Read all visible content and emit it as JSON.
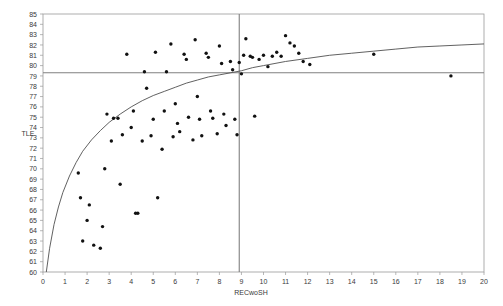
{
  "chart_data": {
    "type": "scatter",
    "title": "",
    "xlabel": "RECwoSH",
    "ylabel": "TLE",
    "xlim": [
      0,
      20
    ],
    "ylim": [
      60,
      85
    ],
    "grid": false,
    "legend": null,
    "x_ticks": [
      0,
      1,
      2,
      3,
      4,
      5,
      6,
      7,
      8,
      9,
      10,
      11,
      12,
      13,
      14,
      15,
      16,
      17,
      18,
      19,
      20
    ],
    "y_ticks": [
      60,
      61,
      62,
      63,
      64,
      65,
      66,
      67,
      68,
      69,
      70,
      71,
      72,
      73,
      74,
      75,
      76,
      77,
      78,
      79,
      80,
      81,
      82,
      83,
      84,
      85
    ],
    "x_tick_labels": [
      "0",
      "1",
      "2",
      "3",
      "4",
      "5",
      "6",
      "7",
      "8",
      "9",
      "10",
      "11",
      "12",
      "13",
      "14",
      "15",
      "16",
      "17",
      "18",
      "19",
      "20"
    ],
    "y_tick_labels": [
      "60",
      "61",
      "62",
      "63",
      "64",
      "65",
      "66",
      "67",
      "68",
      "69",
      "70",
      "71",
      "72",
      "73",
      "74",
      "75",
      "76",
      "77",
      "78",
      "79",
      "80",
      "81",
      "82",
      "83",
      "84",
      "85"
    ],
    "reference_lines": [
      {
        "orientation": "horizontal",
        "value": 79.3,
        "color": "#808080"
      },
      {
        "orientation": "vertical",
        "value": 8.9,
        "color": "#808080"
      }
    ],
    "fit_curve": {
      "kind": "logarithmic",
      "color": "#4f4f4f",
      "points": [
        [
          0.15,
          60.0
        ],
        [
          0.3,
          62.3
        ],
        [
          0.5,
          64.6
        ],
        [
          0.7,
          66.3
        ],
        [
          0.9,
          67.7
        ],
        [
          1.2,
          69.3
        ],
        [
          1.5,
          70.6
        ],
        [
          1.8,
          71.7
        ],
        [
          2.2,
          72.8
        ],
        [
          2.6,
          73.7
        ],
        [
          3.0,
          74.5
        ],
        [
          3.5,
          75.3
        ],
        [
          4.0,
          76.0
        ],
        [
          4.5,
          76.6
        ],
        [
          5.0,
          77.1
        ],
        [
          5.5,
          77.5
        ],
        [
          6.0,
          77.9
        ],
        [
          6.5,
          78.3
        ],
        [
          7.0,
          78.6
        ],
        [
          7.5,
          78.9
        ],
        [
          8.0,
          79.1
        ],
        [
          8.5,
          79.3
        ],
        [
          9.0,
          79.5
        ],
        [
          9.5,
          79.8
        ],
        [
          10.0,
          80.0
        ],
        [
          11.0,
          80.4
        ],
        [
          12.0,
          80.7
        ],
        [
          13.0,
          81.0
        ],
        [
          14.0,
          81.2
        ],
        [
          15.0,
          81.4
        ],
        [
          16.0,
          81.6
        ],
        [
          17.0,
          81.8
        ],
        [
          18.0,
          81.9
        ],
        [
          19.0,
          82.0
        ],
        [
          20.0,
          82.1
        ]
      ]
    },
    "points": [
      [
        1.6,
        69.6
      ],
      [
        1.7,
        67.2
      ],
      [
        1.8,
        63.0
      ],
      [
        2.0,
        65.0
      ],
      [
        2.1,
        66.5
      ],
      [
        2.3,
        62.6
      ],
      [
        2.6,
        62.3
      ],
      [
        2.7,
        64.4
      ],
      [
        2.8,
        70.0
      ],
      [
        2.9,
        75.3
      ],
      [
        3.1,
        72.7
      ],
      [
        3.2,
        74.9
      ],
      [
        3.4,
        74.9
      ],
      [
        3.5,
        68.5
      ],
      [
        3.6,
        73.3
      ],
      [
        3.8,
        81.1
      ],
      [
        4.0,
        74.0
      ],
      [
        4.1,
        75.6
      ],
      [
        4.2,
        65.7
      ],
      [
        4.3,
        65.7
      ],
      [
        4.5,
        72.7
      ],
      [
        4.6,
        79.4
      ],
      [
        4.7,
        77.8
      ],
      [
        4.9,
        73.2
      ],
      [
        5.0,
        74.8
      ],
      [
        5.1,
        81.3
      ],
      [
        5.2,
        67.2
      ],
      [
        5.4,
        71.9
      ],
      [
        5.5,
        75.6
      ],
      [
        5.6,
        79.4
      ],
      [
        5.8,
        82.1
      ],
      [
        5.9,
        73.1
      ],
      [
        6.0,
        76.3
      ],
      [
        6.1,
        74.4
      ],
      [
        6.2,
        73.6
      ],
      [
        6.4,
        81.1
      ],
      [
        6.5,
        80.6
      ],
      [
        6.6,
        75.0
      ],
      [
        6.8,
        72.8
      ],
      [
        6.9,
        82.5
      ],
      [
        7.0,
        77.0
      ],
      [
        7.1,
        74.8
      ],
      [
        7.2,
        73.2
      ],
      [
        7.4,
        81.2
      ],
      [
        7.5,
        80.8
      ],
      [
        7.6,
        75.6
      ],
      [
        7.7,
        74.9
      ],
      [
        7.9,
        73.4
      ],
      [
        8.0,
        81.9
      ],
      [
        8.1,
        80.2
      ],
      [
        8.2,
        75.3
      ],
      [
        8.3,
        74.2
      ],
      [
        8.5,
        80.4
      ],
      [
        8.6,
        79.6
      ],
      [
        8.7,
        74.8
      ],
      [
        8.8,
        73.3
      ],
      [
        8.9,
        80.3
      ],
      [
        9.0,
        79.2
      ],
      [
        9.1,
        81.0
      ],
      [
        9.2,
        82.6
      ],
      [
        9.4,
        80.9
      ],
      [
        9.5,
        80.8
      ],
      [
        9.6,
        75.1
      ],
      [
        9.8,
        80.6
      ],
      [
        10.0,
        81.0
      ],
      [
        10.2,
        79.9
      ],
      [
        10.4,
        80.9
      ],
      [
        10.6,
        81.3
      ],
      [
        10.8,
        80.9
      ],
      [
        11.0,
        82.9
      ],
      [
        11.2,
        82.2
      ],
      [
        11.4,
        81.9
      ],
      [
        11.6,
        81.2
      ],
      [
        11.8,
        80.4
      ],
      [
        12.1,
        80.1
      ],
      [
        15.0,
        81.1
      ],
      [
        18.5,
        79.0
      ]
    ]
  },
  "axis_labels": {
    "x": "RECwoSH",
    "y": "TLE"
  }
}
